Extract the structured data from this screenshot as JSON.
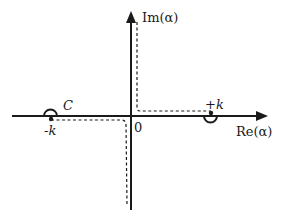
{
  "diagram": {
    "type": "complex-plane contour",
    "axes": {
      "x_label": "Re(α)",
      "y_label": "Im(α)",
      "origin_label": "0"
    },
    "points": {
      "minus_k_label": "-k",
      "plus_k_label": "+k"
    },
    "contour": {
      "label": "C",
      "style": "dashed",
      "indent_minus_k": "semicircle above",
      "indent_plus_k": "semicircle below"
    },
    "colors": {
      "ink": "#1a1a1a",
      "background": "#ffffff"
    }
  }
}
